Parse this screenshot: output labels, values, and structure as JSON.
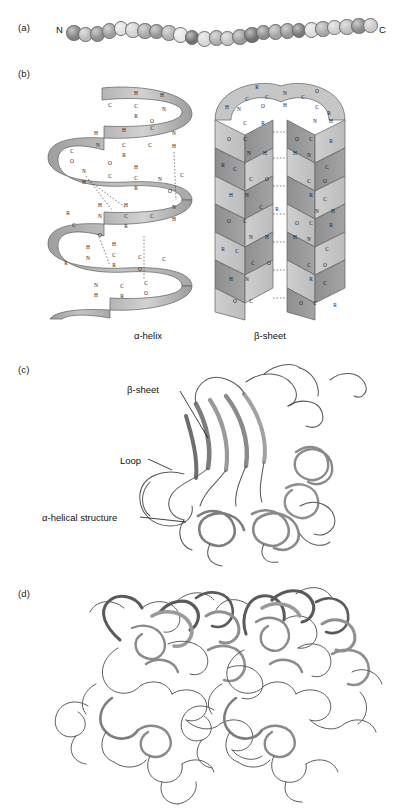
{
  "figure": {
    "panels": [
      {
        "id": "a",
        "label": "(a)",
        "caption": "",
        "description": "primary-structure-bead-chain"
      },
      {
        "id": "b",
        "label": "(b)",
        "caption": "",
        "description": "secondary-structure-helix-and-sheet"
      },
      {
        "id": "c",
        "label": "(c)",
        "caption": "",
        "description": "tertiary-structure-ribbon"
      },
      {
        "id": "d",
        "label": "(d)",
        "caption": "",
        "description": "quaternary-structure-two-subunits"
      }
    ]
  },
  "panel_a": {
    "n_terminus": "N",
    "c_terminus": "C",
    "bead_count": 26,
    "bead_shades": [
      "#808080",
      "#b9b9b9",
      "#8f8f8f",
      "#9e9e9e",
      "#e2e2e2",
      "#d2d2d2",
      "#a6a6a6",
      "#949494",
      "#b0b0b0",
      "#e6e6e6",
      "#707070",
      "#d8d8d8",
      "#aeaeae",
      "#c4c4c4",
      "#9a9a9a",
      "#6f6f6f",
      "#8c8c8c",
      "#a2a2a2",
      "#979797",
      "#767676",
      "#dcdcdc",
      "#a8a8a8",
      "#cfcfcf",
      "#bdbdbd",
      "#8a8a8a",
      "#c9c9c9"
    ]
  },
  "panel_b": {
    "alpha_helix_label": "α-helix",
    "beta_sheet_label": "β-sheet",
    "ribbon_fill_light": "#c9c9c9",
    "ribbon_fill_mid": "#b0b0b0",
    "ribbon_fill_dark": "#8d8d8d",
    "atom_labels": [
      "C",
      "N",
      "H",
      "O",
      "R"
    ],
    "helix_atoms": [
      {
        "t": "C",
        "x": 70,
        "y": 22
      },
      {
        "t": "H",
        "x": 96,
        "y": 10
      },
      {
        "t": "C",
        "x": 96,
        "y": 23
      },
      {
        "t": "R",
        "x": 96,
        "y": 33
      },
      {
        "t": "H",
        "x": 122,
        "y": 12
      },
      {
        "t": "N",
        "x": 124,
        "y": 26
      },
      {
        "t": "O",
        "x": 112,
        "y": 38
      },
      {
        "t": "C",
        "x": 112,
        "y": 45
      },
      {
        "t": "H",
        "x": 56,
        "y": 50
      },
      {
        "t": "H",
        "x": 84,
        "y": 47
      },
      {
        "t": "N",
        "x": 58,
        "y": 62
      },
      {
        "t": "C",
        "x": 84,
        "y": 62
      },
      {
        "t": "R",
        "x": 84,
        "y": 72
      },
      {
        "t": "C",
        "x": 110,
        "y": 62
      },
      {
        "t": "N",
        "x": 134,
        "y": 50
      },
      {
        "t": "H",
        "x": 134,
        "y": 63
      },
      {
        "t": "C",
        "x": 32,
        "y": 68
      },
      {
        "t": "O",
        "x": 32,
        "y": 78
      },
      {
        "t": "O",
        "x": 70,
        "y": 80
      },
      {
        "t": "N",
        "x": 44,
        "y": 88
      },
      {
        "t": "H",
        "x": 44,
        "y": 99
      },
      {
        "t": "C",
        "x": 70,
        "y": 93
      },
      {
        "t": "H",
        "x": 96,
        "y": 84
      },
      {
        "t": "C",
        "x": 96,
        "y": 95
      },
      {
        "t": "R",
        "x": 96,
        "y": 105
      },
      {
        "t": "N",
        "x": 120,
        "y": 96
      },
      {
        "t": "C",
        "x": 142,
        "y": 92
      },
      {
        "t": "O",
        "x": 130,
        "y": 108
      },
      {
        "t": "H",
        "x": 60,
        "y": 122
      },
      {
        "t": "N",
        "x": 60,
        "y": 133
      },
      {
        "t": "R",
        "x": 28,
        "y": 130
      },
      {
        "t": "C",
        "x": 34,
        "y": 142
      },
      {
        "t": "C",
        "x": 86,
        "y": 133
      },
      {
        "t": "H",
        "x": 86,
        "y": 122
      },
      {
        "t": "R",
        "x": 86,
        "y": 143
      },
      {
        "t": "O",
        "x": 60,
        "y": 152
      },
      {
        "t": "C",
        "x": 112,
        "y": 133
      },
      {
        "t": "N",
        "x": 134,
        "y": 124
      },
      {
        "t": "H",
        "x": 134,
        "y": 136
      },
      {
        "t": "H",
        "x": 48,
        "y": 164
      },
      {
        "t": "N",
        "x": 48,
        "y": 175
      },
      {
        "t": "C",
        "x": 74,
        "y": 172
      },
      {
        "t": "H",
        "x": 74,
        "y": 161
      },
      {
        "t": "R",
        "x": 74,
        "y": 182
      },
      {
        "t": "C",
        "x": 100,
        "y": 174
      },
      {
        "t": "O",
        "x": 100,
        "y": 186
      },
      {
        "t": "R",
        "x": 26,
        "y": 180
      },
      {
        "t": "C",
        "x": 124,
        "y": 176
      },
      {
        "t": "N",
        "x": 56,
        "y": 202
      },
      {
        "t": "H",
        "x": 56,
        "y": 212
      },
      {
        "t": "C",
        "x": 82,
        "y": 203
      },
      {
        "t": "R",
        "x": 82,
        "y": 213
      },
      {
        "t": "O",
        "x": 106,
        "y": 210
      },
      {
        "t": "C",
        "x": 106,
        "y": 200
      }
    ],
    "sheet_atoms": [
      {
        "t": "R",
        "x": 52,
        "y": 8
      },
      {
        "t": "C",
        "x": 42,
        "y": 20
      },
      {
        "t": "C",
        "x": 62,
        "y": 18
      },
      {
        "t": "N",
        "x": 80,
        "y": 14
      },
      {
        "t": "C",
        "x": 98,
        "y": 18
      },
      {
        "t": "O",
        "x": 112,
        "y": 12
      },
      {
        "t": "H",
        "x": 22,
        "y": 28
      },
      {
        "t": "N",
        "x": 34,
        "y": 30
      },
      {
        "t": "O",
        "x": 58,
        "y": 27
      },
      {
        "t": "H",
        "x": 80,
        "y": 26
      },
      {
        "t": "C",
        "x": 112,
        "y": 28
      },
      {
        "t": "R",
        "x": 124,
        "y": 34
      },
      {
        "t": "C",
        "x": 40,
        "y": 44
      },
      {
        "t": "R",
        "x": 58,
        "y": 44
      },
      {
        "t": "N",
        "x": 110,
        "y": 42
      },
      {
        "t": "H",
        "x": 126,
        "y": 42
      },
      {
        "t": "O",
        "x": 24,
        "y": 60
      },
      {
        "t": "C",
        "x": 40,
        "y": 60
      },
      {
        "t": "O",
        "x": 92,
        "y": 60
      },
      {
        "t": "C",
        "x": 106,
        "y": 60
      },
      {
        "t": "R",
        "x": 126,
        "y": 62
      },
      {
        "t": "N",
        "x": 44,
        "y": 74
      },
      {
        "t": "H",
        "x": 60,
        "y": 74
      },
      {
        "t": "H",
        "x": 90,
        "y": 74
      },
      {
        "t": "N",
        "x": 104,
        "y": 76
      },
      {
        "t": "R",
        "x": 18,
        "y": 86
      },
      {
        "t": "C",
        "x": 30,
        "y": 90
      },
      {
        "t": "C",
        "x": 122,
        "y": 88
      },
      {
        "t": "C",
        "x": 46,
        "y": 100
      },
      {
        "t": "O",
        "x": 62,
        "y": 100
      },
      {
        "t": "C",
        "x": 104,
        "y": 102
      },
      {
        "t": "O",
        "x": 120,
        "y": 102
      },
      {
        "t": "H",
        "x": 26,
        "y": 116
      },
      {
        "t": "N",
        "x": 42,
        "y": 116
      },
      {
        "t": "R",
        "x": 106,
        "y": 116
      },
      {
        "t": "C",
        "x": 120,
        "y": 120
      },
      {
        "t": "C",
        "x": 56,
        "y": 128
      },
      {
        "t": "R",
        "x": 72,
        "y": 130
      },
      {
        "t": "N",
        "x": 112,
        "y": 132
      },
      {
        "t": "H",
        "x": 128,
        "y": 132
      },
      {
        "t": "O",
        "x": 24,
        "y": 142
      },
      {
        "t": "C",
        "x": 40,
        "y": 142
      },
      {
        "t": "O",
        "x": 92,
        "y": 144
      },
      {
        "t": "C",
        "x": 106,
        "y": 144
      },
      {
        "t": "R",
        "x": 126,
        "y": 146
      },
      {
        "t": "N",
        "x": 46,
        "y": 158
      },
      {
        "t": "H",
        "x": 62,
        "y": 158
      },
      {
        "t": "H",
        "x": 90,
        "y": 158
      },
      {
        "t": "N",
        "x": 104,
        "y": 160
      },
      {
        "t": "R",
        "x": 18,
        "y": 170
      },
      {
        "t": "C",
        "x": 32,
        "y": 172
      },
      {
        "t": "C",
        "x": 122,
        "y": 170
      },
      {
        "t": "C",
        "x": 48,
        "y": 184
      },
      {
        "t": "O",
        "x": 64,
        "y": 184
      },
      {
        "t": "C",
        "x": 104,
        "y": 186
      },
      {
        "t": "O",
        "x": 120,
        "y": 186
      },
      {
        "t": "H",
        "x": 26,
        "y": 200
      },
      {
        "t": "N",
        "x": 42,
        "y": 200
      },
      {
        "t": "R",
        "x": 106,
        "y": 200
      },
      {
        "t": "C",
        "x": 120,
        "y": 204
      },
      {
        "t": "O",
        "x": 30,
        "y": 222
      },
      {
        "t": "C",
        "x": 46,
        "y": 222
      },
      {
        "t": "O",
        "x": 96,
        "y": 224
      },
      {
        "t": "C",
        "x": 110,
        "y": 224
      },
      {
        "t": "R",
        "x": 130,
        "y": 226
      }
    ]
  },
  "panel_c": {
    "callouts": [
      {
        "name": "beta-sheet",
        "text": "β-sheet"
      },
      {
        "name": "loop",
        "text": "Loop"
      },
      {
        "name": "alpha-helical-structure",
        "text": "α-helical structure"
      }
    ],
    "ribbon_color": "#9a9a9a",
    "ribbon_outline": "#4a4a4a"
  },
  "panel_d": {
    "subunit_count": 2,
    "ribbon_color": "#9a9a9a",
    "ribbon_outline": "#4a4a4a"
  }
}
